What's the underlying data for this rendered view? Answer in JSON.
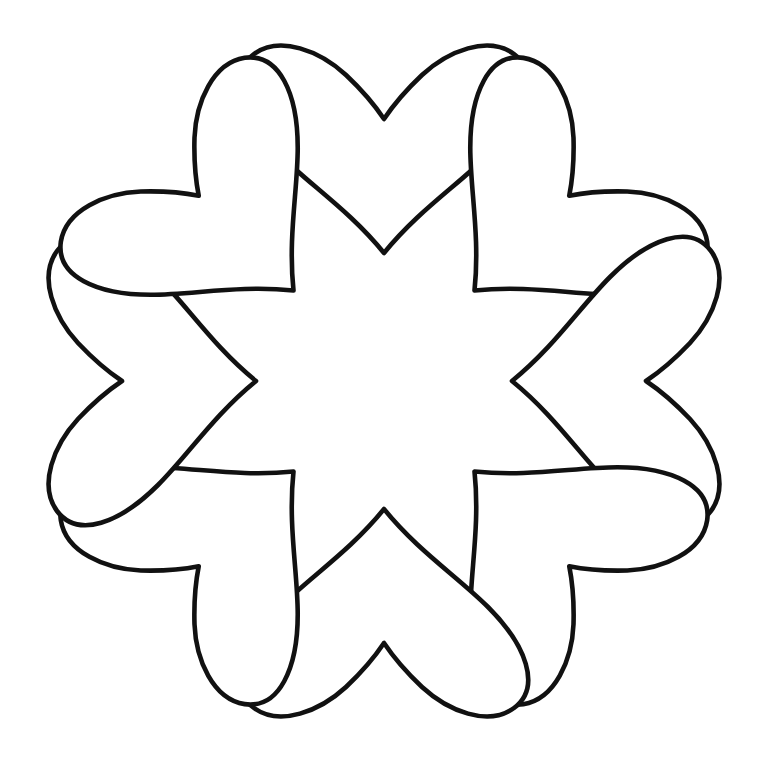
{
  "document": {
    "title": "Flower Outline Coloring Page",
    "kind": "line-art-drawing",
    "subject": "eight-petal flower",
    "background_color": "#ffffff",
    "stroke_color": "#111111",
    "fill_color": "#ffffff",
    "canvas": {
      "width": 768,
      "height": 762
    }
  },
  "drawing": {
    "name": "eight-petal-flower-outline",
    "stroke_width": 4.6,
    "center": {
      "x": 384,
      "y": 381
    },
    "bounds": {
      "left": 15,
      "top": 50,
      "right": 730,
      "bottom": 713
    },
    "petal_count": 8,
    "petal_shape": "heart-with-outer-notch",
    "petal_tip_radius": 330,
    "petal_base_radius": 128,
    "rotation_offset_deg": 0,
    "petals": [
      {
        "name": "petal-top",
        "angle_deg": 0,
        "notch_x": 384,
        "notch_y": 85
      },
      {
        "name": "petal-top-right",
        "angle_deg": 45,
        "notch_x": 596,
        "notch_y": 169
      },
      {
        "name": "petal-right",
        "angle_deg": 90,
        "notch_x": 650,
        "notch_y": 230
      },
      {
        "name": "petal-bottom-right",
        "angle_deg": 135,
        "notch_x": 650,
        "notch_y": 545
      },
      {
        "name": "petal-bottom",
        "angle_deg": 180,
        "notch_x": 384,
        "notch_y": 680
      },
      {
        "name": "petal-bottom-left",
        "angle_deg": 225,
        "notch_x": 87,
        "notch_y": 527
      },
      {
        "name": "petal-left",
        "angle_deg": 270,
        "notch_x": 96,
        "notch_y": 222
      },
      {
        "name": "petal-top-left",
        "angle_deg": 315,
        "notch_x": 172,
        "notch_y": 172
      }
    ],
    "petal_path": "M 0 -128 C -34 -170 -74 -196 -104 -226 C -142 -264 -158 -306 -130 -327 C -104 -346 -64 -330 -38 -306 C -20 -289 -8 -274 0 -262 C 8 -274 20 -289 38 -306 C 64 -330 104 -346 130 -327 C 158 -306 142 -264 104 -226 C 74 -196 34 -170 0 -128 Z"
  }
}
